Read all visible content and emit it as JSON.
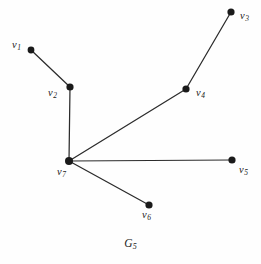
{
  "figure": {
    "caption_base": "G",
    "caption_sub": "5",
    "caption_full": "G5",
    "background_color": "#fefefe",
    "edge_color": "#2b2b2b",
    "vertex_color": "#1a1a1a",
    "width": 261,
    "height": 264
  },
  "graph": {
    "vertices": [
      {
        "id": "v1",
        "base": "v",
        "sub": "1",
        "label": "v1",
        "cx": 31,
        "cy": 50,
        "r": 3.4,
        "label_x": 12,
        "label_y": 40,
        "label_align": "right"
      },
      {
        "id": "v2",
        "base": "v",
        "sub": "2",
        "label": "v2",
        "cx": 70,
        "cy": 87,
        "r": 3.6,
        "label_x": 48,
        "label_y": 88,
        "label_align": "right"
      },
      {
        "id": "v3",
        "base": "v",
        "sub": "3",
        "label": "v3",
        "cx": 231,
        "cy": 12,
        "r": 3.6,
        "label_x": 240,
        "label_y": 11,
        "label_align": "left"
      },
      {
        "id": "v4",
        "base": "v",
        "sub": "4",
        "label": "v4",
        "cx": 186,
        "cy": 89,
        "r": 3.6,
        "label_x": 196,
        "label_y": 88,
        "label_align": "left"
      },
      {
        "id": "v5",
        "base": "v",
        "sub": "5",
        "label": "v5",
        "cx": 232,
        "cy": 160,
        "r": 3.6,
        "label_x": 239,
        "label_y": 165,
        "label_align": "left"
      },
      {
        "id": "v6",
        "base": "v",
        "sub": "6",
        "label": "v6",
        "cx": 149,
        "cy": 205,
        "r": 3.6,
        "label_x": 142,
        "label_y": 210,
        "label_align": "left"
      },
      {
        "id": "v7",
        "base": "v",
        "sub": "7",
        "label": "v7",
        "cx": 69,
        "cy": 161,
        "r": 4.0,
        "label_x": 57,
        "label_y": 167,
        "label_align": "left"
      }
    ],
    "edges": [
      {
        "id": "e-v1-v2",
        "from": "v1",
        "to": "v2",
        "x1": 31,
        "y1": 50,
        "x2": 70,
        "y2": 87
      },
      {
        "id": "e-v2-v7",
        "from": "v2",
        "to": "v7",
        "x1": 70,
        "y1": 87,
        "x2": 69,
        "y2": 161
      },
      {
        "id": "e-v3-v4",
        "from": "v3",
        "to": "v4",
        "x1": 231,
        "y1": 12,
        "x2": 186,
        "y2": 89
      },
      {
        "id": "e-v4-v7",
        "from": "v4",
        "to": "v7",
        "x1": 186,
        "y1": 89,
        "x2": 69,
        "y2": 161
      },
      {
        "id": "e-v7-v5",
        "from": "v7",
        "to": "v5",
        "x1": 69,
        "y1": 161,
        "x2": 232,
        "y2": 160
      },
      {
        "id": "e-v7-v6",
        "from": "v7",
        "to": "v6",
        "x1": 69,
        "y1": 161,
        "x2": 149,
        "y2": 205
      }
    ]
  }
}
